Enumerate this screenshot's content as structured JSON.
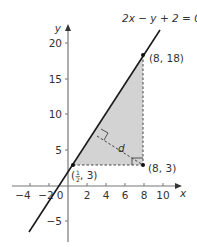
{
  "diagram": {
    "equation_label": "2x − y + 2 = 0",
    "axes": {
      "x_label": "x",
      "y_label": "y",
      "origin_label": "0",
      "x_ticks": [
        "−4",
        "−2",
        "2",
        "4",
        "6",
        "8",
        "10"
      ],
      "y_ticks": [
        "20",
        "15",
        "10",
        "5",
        "−5"
      ]
    },
    "points": {
      "top": "(8, 18)",
      "bottom_right": "(8, 3)",
      "left_label_prefix": "(",
      "left_label_num": "1",
      "left_label_den": "2",
      "left_label_suffix": ", 3)"
    },
    "distance_label": "d",
    "colors": {
      "line": "#1a1a1a",
      "axis": "#777777",
      "shade": "#d3d3d3",
      "dashed": "#444444"
    }
  }
}
